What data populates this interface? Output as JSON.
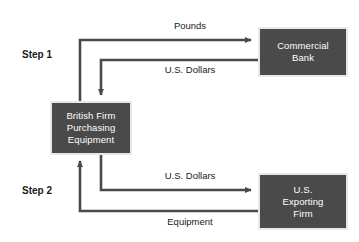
{
  "diagram": {
    "background_color": "#ffffff",
    "node_fill_color": "#4a4a4a",
    "node_border_color": "#e8e8e8",
    "node_text_color": "#ffffff",
    "arrow_color": "#4a4a4a",
    "label_text_color": "#1a1a1a"
  },
  "steps": [
    {
      "label": "Step 1"
    },
    {
      "label": "Step 2"
    }
  ],
  "nodes": {
    "british_firm": {
      "lines": [
        "British Firm",
        "Purchasing",
        "Equipment"
      ]
    },
    "commercial_bank": {
      "lines": [
        "Commercial",
        "Bank"
      ]
    },
    "us_exporting_firm": {
      "lines": [
        "U.S.",
        "Exporting",
        "Firm"
      ]
    }
  },
  "edges": [
    {
      "id": "pounds",
      "label": "Pounds",
      "from": "british_firm",
      "to": "commercial_bank",
      "step": "Step 1"
    },
    {
      "id": "dollars_from_bank",
      "label": "U.S. Dollars",
      "from": "commercial_bank",
      "to": "british_firm",
      "step": "Step 1"
    },
    {
      "id": "dollars_to_exporter",
      "label": "U.S. Dollars",
      "from": "british_firm",
      "to": "us_exporting_firm",
      "step": "Step 2"
    },
    {
      "id": "equipment",
      "label": "Equipment",
      "from": "us_exporting_firm",
      "to": "british_firm",
      "step": "Step 2"
    }
  ]
}
